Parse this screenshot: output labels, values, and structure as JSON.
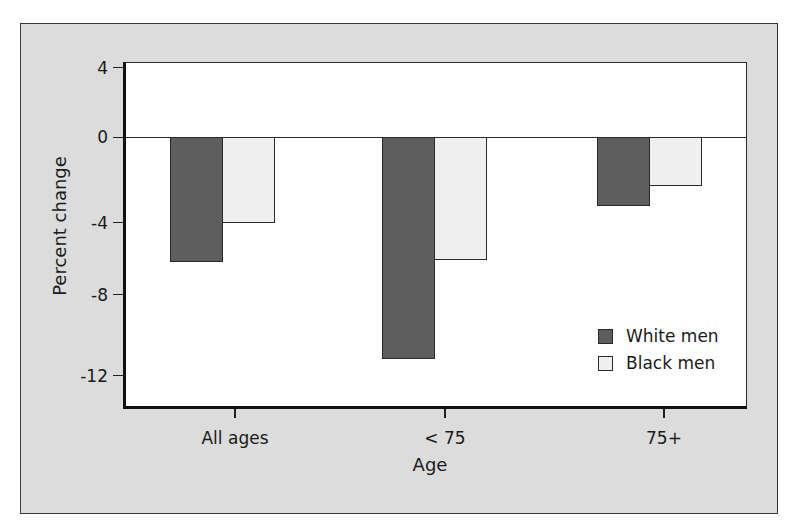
{
  "chart_data": {
    "type": "bar",
    "title": "",
    "xlabel": "Age",
    "ylabel": "Percent change",
    "categories": [
      "All ages",
      "< 75",
      "75+"
    ],
    "series": [
      {
        "name": "White men",
        "color": "#5e5e5e",
        "values": [
          -6.2,
          -11.2,
          -3.2
        ]
      },
      {
        "name": "Black men",
        "color": "#efefef",
        "values": [
          -4.0,
          -6.1,
          -2.3
        ]
      }
    ],
    "yticks": [
      4,
      0,
      -4,
      -8,
      -12
    ],
    "ytick_labels": [
      "4",
      "0",
      "-4",
      "-8",
      "-12"
    ],
    "ylim": [
      -13.6,
      4.3
    ],
    "grid": false,
    "zero_line": true,
    "legend": {
      "position": "lower right inside plot",
      "entries": [
        "White men",
        "Black men"
      ]
    }
  },
  "colors": {
    "frame_background": "#dcdcdc",
    "plot_background": "#ffffff",
    "white_men": "#5e5e5e",
    "black_men": "#efefef",
    "axis": "#111111"
  },
  "labels": {
    "y_axis_title": "Percent change",
    "x_axis_title": "Age",
    "legend_white": "White men",
    "legend_black": "Black men",
    "cat_0": "All ages",
    "cat_1": "< 75",
    "cat_2": "75+",
    "ytick_0": "4",
    "ytick_1": "0",
    "ytick_2": "-4",
    "ytick_3": "-8",
    "ytick_4": "-12"
  }
}
